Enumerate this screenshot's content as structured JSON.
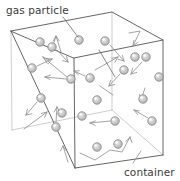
{
  "figure": {
    "background_color": "#ffffff",
    "width": 180,
    "height": 181
  },
  "labels": {
    "gas_particle": "gas particle",
    "container": "container"
  },
  "colors": {
    "text": "#3b3b3b",
    "edge_visible": "#4a4a4a",
    "edge_hidden": "#b9b9b9",
    "arrow": "#8d8d8d",
    "leader": "#6b6b6b",
    "particle_fill": "#c9c9c9",
    "particle_stroke": "#8a8a8a"
  },
  "diagram_data": {
    "type": "schematic",
    "subject": "kinetic molecular theory of gases",
    "shape": "cube wireframe (3D box)",
    "particle_count": 21,
    "particle_radius": 4.2,
    "box_vertices": {
      "back_top_left": [
        11,
        31
      ],
      "back_top_right": [
        112,
        12
      ],
      "front_top_right": [
        163,
        40
      ],
      "front_top_left": [
        74,
        58
      ],
      "back_bottom_left": [
        12,
        130
      ],
      "front_bottom_left": [
        75,
        168
      ],
      "front_bottom_right": [
        163,
        155
      ],
      "back_bottom_right": [
        112,
        110
      ]
    },
    "particles": [
      {
        "id": 1,
        "cx": 52,
        "cy": 47,
        "vx": 8,
        "vy": 10
      },
      {
        "id": 2,
        "cx": 79,
        "cy": 40,
        "vx": 0,
        "vy": 0
      },
      {
        "id": 3,
        "cx": 105,
        "cy": 41,
        "vx": 13,
        "vy": 13
      },
      {
        "id": 4,
        "cx": 146,
        "cy": 57,
        "vx": -11,
        "vy": 11
      },
      {
        "id": 5,
        "cx": 32,
        "cy": 68,
        "vx": 14,
        "vy": -6
      },
      {
        "id": 6,
        "cx": 124,
        "cy": 70,
        "vx": -10,
        "vy": 10
      },
      {
        "id": 7,
        "cx": 71,
        "cy": 79,
        "vx": -19,
        "vy": -2
      },
      {
        "id": 8,
        "cx": 90,
        "cy": 78,
        "vx": -10,
        "vy": -5
      },
      {
        "id": 9,
        "cx": 159,
        "cy": 77,
        "vx": 0,
        "vy": 0
      },
      {
        "id": 10,
        "cx": 41,
        "cy": 98,
        "vx": -10,
        "vy": 12
      },
      {
        "id": 11,
        "cx": 143,
        "cy": 99,
        "vx": 0,
        "vy": 0
      },
      {
        "id": 12,
        "cx": 82,
        "cy": 116,
        "vx": 0,
        "vy": 0
      },
      {
        "id": 13,
        "cx": 115,
        "cy": 121,
        "vx": -14,
        "vy": 2
      },
      {
        "id": 14,
        "cx": 56,
        "cy": 127,
        "vx": 1,
        "vy": -14
      },
      {
        "id": 15,
        "cx": 152,
        "cy": 121,
        "vx": -12,
        "vy": -7
      },
      {
        "id": 16,
        "cx": 97,
        "cy": 147,
        "vx": 0,
        "vy": 0
      },
      {
        "id": 17,
        "cx": 118,
        "cy": 144,
        "vx": 0,
        "vy": 0
      },
      {
        "id": 18,
        "cx": 51,
        "cy": 49,
        "vx": 0,
        "vy": 0
      },
      {
        "id": 19,
        "cx": 135,
        "cy": 57,
        "vx": 0,
        "vy": 0
      },
      {
        "id": 20,
        "cx": 62,
        "cy": 113,
        "vx": 0,
        "vy": 0
      },
      {
        "id": 21,
        "cx": 97,
        "cy": 100,
        "vx": 0,
        "vy": 0
      }
    ],
    "annotations": [
      {
        "label": "gas particle",
        "anchor": [
          8,
          15
        ],
        "points_to": [
          79,
          40
        ]
      },
      {
        "label": "container",
        "anchor": [
          124,
          174
        ],
        "points_to": [
          146,
          150
        ]
      }
    ]
  }
}
